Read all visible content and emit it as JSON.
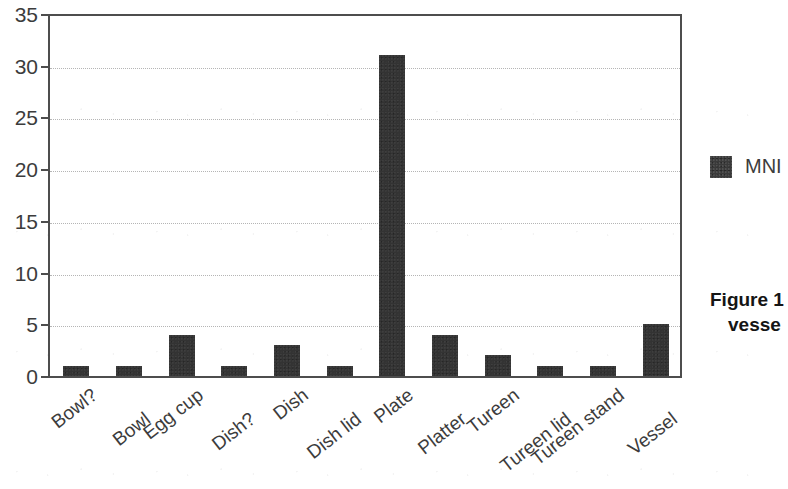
{
  "chart_data": {
    "type": "bar",
    "title": "",
    "xlabel": "",
    "ylabel": "",
    "ylim": [
      0,
      35
    ],
    "yticks": [
      0,
      5,
      10,
      15,
      20,
      25,
      30,
      35
    ],
    "grid": "horizontal-dotted",
    "legend_position": "right",
    "categories": [
      "Bowl?",
      "Bowl",
      "Egg cup",
      "Dish?",
      "Dish",
      "Dish lid",
      "Plate",
      "Platter",
      "Tureen",
      "Tureen lid",
      "Tureen stand",
      "Vessel"
    ],
    "series": [
      {
        "name": "MNI",
        "color": "#333333",
        "values": [
          1,
          1,
          4,
          1,
          3,
          1,
          31,
          4,
          2,
          1,
          1,
          5
        ]
      }
    ]
  },
  "legend": {
    "entries": [
      {
        "label": "MNI",
        "swatch_color": "#3a3a3a"
      }
    ]
  },
  "caption": {
    "line1": "Figure 1",
    "line2": "vesse"
  },
  "axis": {
    "tick_color": "#4d4d4d",
    "label_color": "#3c3c3c",
    "grid_color": "#b5b5b5"
  }
}
